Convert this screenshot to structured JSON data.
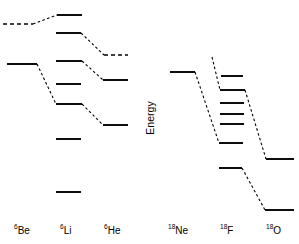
{
  "figure": {
    "axis": {
      "energy_label": "Energy",
      "orientation": "vertical",
      "direction": "increasing-upward",
      "ticks_shown": false,
      "units_shown": false
    },
    "width": 299,
    "height": 244,
    "background_color": "#ffffff",
    "line_color": "#000000"
  },
  "chart_data": {
    "type": "line",
    "xlabel": "",
    "ylabel": "Energy",
    "grid": false,
    "legend": "none",
    "axis_note": "Energy axis increases upward; no numeric scale shown",
    "columns": [
      {
        "name": "6Be",
        "mass_number": "6",
        "element": "Be",
        "label_x": 22,
        "levels": [
          {
            "id": "Be6-L1",
            "style": "dashed",
            "x1": 3,
            "x2": 33,
            "y": 24
          },
          {
            "id": "Be6-L2",
            "style": "solid",
            "x1": 7,
            "x2": 37,
            "y": 64
          }
        ]
      },
      {
        "name": "6Li",
        "mass_number": "6",
        "element": "Li",
        "label_x": 68,
        "levels": [
          {
            "id": "Li6-L1",
            "style": "solid",
            "x1": 57,
            "x2": 82,
            "y": 15
          },
          {
            "id": "Li6-L2",
            "style": "solid",
            "x1": 56,
            "x2": 81,
            "y": 33
          },
          {
            "id": "Li6-L3",
            "style": "solid",
            "x1": 56,
            "x2": 82,
            "y": 61
          },
          {
            "id": "Li6-L4",
            "style": "solid",
            "x1": 56,
            "x2": 81,
            "y": 84
          },
          {
            "id": "Li6-L5",
            "style": "solid",
            "x1": 56,
            "x2": 82,
            "y": 104
          },
          {
            "id": "Li6-L6",
            "style": "solid",
            "x1": 56,
            "x2": 81,
            "y": 139
          },
          {
            "id": "Li6-L7",
            "style": "solid",
            "x1": 56,
            "x2": 81,
            "y": 192
          }
        ]
      },
      {
        "name": "6He",
        "mass_number": "6",
        "element": "He",
        "label_x": 111,
        "levels": [
          {
            "id": "He6-L1",
            "style": "dashed",
            "x1": 104,
            "x2": 128,
            "y": 55
          },
          {
            "id": "He6-L2",
            "style": "solid",
            "x1": 103,
            "x2": 128,
            "y": 80
          },
          {
            "id": "He6-L3",
            "style": "solid",
            "x1": 103,
            "x2": 128,
            "y": 125
          }
        ]
      },
      {
        "name": "18Ne",
        "mass_number": "18",
        "element": "Ne",
        "label_x": 178,
        "levels": [
          {
            "id": "Ne18-L1",
            "style": "solid",
            "x1": 170,
            "x2": 195,
            "y": 72
          }
        ]
      },
      {
        "name": "18F",
        "mass_number": "18",
        "element": "F",
        "label_x": 228,
        "levels": [
          {
            "id": "F18-L1",
            "style": "solid",
            "x1": 221,
            "x2": 243,
            "y": 76
          },
          {
            "id": "F18-L2",
            "style": "solid",
            "x1": 220,
            "x2": 245,
            "y": 90
          },
          {
            "id": "F18-L3",
            "style": "solid",
            "x1": 220,
            "x2": 244,
            "y": 103
          },
          {
            "id": "F18-L4",
            "style": "solid",
            "x1": 220,
            "x2": 244,
            "y": 114
          },
          {
            "id": "F18-L5",
            "style": "solid",
            "x1": 220,
            "x2": 244,
            "y": 124
          },
          {
            "id": "F18-L6",
            "style": "solid",
            "x1": 219,
            "x2": 243,
            "y": 143
          },
          {
            "id": "F18-L7",
            "style": "solid",
            "x1": 219,
            "x2": 242,
            "y": 168
          }
        ]
      },
      {
        "name": "18O",
        "mass_number": "18",
        "element": "O",
        "label_x": 274,
        "levels": [
          {
            "id": "O18-L1",
            "style": "solid",
            "x1": 266,
            "x2": 294,
            "y": 159
          },
          {
            "id": "O18-L2",
            "style": "solid",
            "x1": 265,
            "x2": 294,
            "y": 210
          }
        ]
      }
    ],
    "connectors": [
      {
        "id": "C1",
        "from": "Be6-L1",
        "to": "Li6-L1",
        "x1": 33,
        "y1": 24,
        "x2": 57,
        "y2": 15
      },
      {
        "id": "C2",
        "from": "Li6-L2",
        "to": "He6-L1",
        "x1": 81,
        "y1": 33,
        "x2": 104,
        "y2": 55
      },
      {
        "id": "C3",
        "from": "Be6-L2",
        "to": "Li6-L3",
        "x1": 37,
        "y1": 64,
        "x2": 56,
        "y2": 104
      },
      {
        "id": "C4",
        "from": "Li6-L3",
        "to": "He6-L2",
        "x1": 82,
        "y1": 61,
        "x2": 103,
        "y2": 80
      },
      {
        "id": "C5",
        "from": "Li6-L5",
        "to": "He6-L3",
        "x1": 82,
        "y1": 104,
        "x2": 103,
        "y2": 125
      },
      {
        "id": "C6",
        "from": "Ne18-L1",
        "to": "F18-L6",
        "x1": 195,
        "y1": 72,
        "x2": 219,
        "y2": 143
      },
      {
        "id": "C7",
        "from": "F18-apex",
        "to": "F18-L2",
        "x1": 212,
        "y1": 57,
        "x2": 220,
        "y2": 90
      },
      {
        "id": "C8",
        "from": "F18-L2",
        "to": "O18-L1",
        "x1": 245,
        "y1": 90,
        "x2": 266,
        "y2": 159
      },
      {
        "id": "C9",
        "from": "F18-L7",
        "to": "O18-L2",
        "x1": 242,
        "y1": 168,
        "x2": 265,
        "y2": 210
      }
    ]
  },
  "labels": {
    "energy_axis": "Energy",
    "nuclides": [
      {
        "mass": "6",
        "element": "Be",
        "x": 14,
        "y": 234
      },
      {
        "mass": "6",
        "element": "Li",
        "x": 60,
        "y": 234
      },
      {
        "mass": "6",
        "element": "He",
        "x": 104,
        "y": 234
      },
      {
        "mass": "18",
        "element": "Ne",
        "x": 168,
        "y": 234
      },
      {
        "mass": "18",
        "element": "F",
        "x": 220,
        "y": 234
      },
      {
        "mass": "18",
        "element": "O",
        "x": 266,
        "y": 234
      }
    ]
  }
}
